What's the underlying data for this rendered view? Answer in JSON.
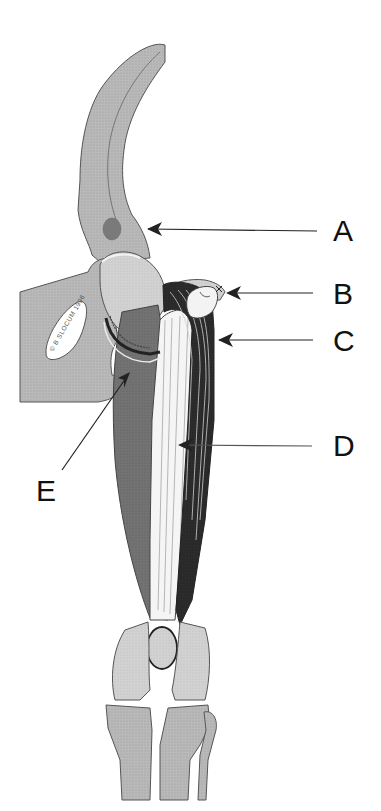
{
  "figure": {
    "copyright": "© B SLOCUM 1996",
    "colors": {
      "bone": "#c9c9c9",
      "bone_light": "#dcdcdc",
      "pelvis": "#b3b3b3",
      "muscle_medium": "#6f6f6f",
      "muscle_dark": "#2a2a2a",
      "tendon_white": "#f4f4f4",
      "outline": "#4a4a4a",
      "arrow": "#222222"
    }
  },
  "labels": [
    {
      "id": "A",
      "text": "A",
      "target": "ilium / cranial ventral iliac spine region"
    },
    {
      "id": "B",
      "text": "B",
      "target": "greater trochanter"
    },
    {
      "id": "C",
      "text": "C",
      "target": "dark lateral muscle"
    },
    {
      "id": "D",
      "text": "D",
      "target": "white striated muscle"
    },
    {
      "id": "E",
      "text": "E",
      "target": "medial muscle near hip joint"
    }
  ]
}
